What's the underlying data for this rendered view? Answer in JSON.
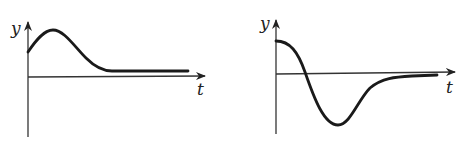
{
  "graphs": [
    {
      "name": "left-graph",
      "y_label": "y",
      "x_label": "t",
      "description": "Curve starts at positive y, rises to a peak, then decays to a positive constant level above the t-axis"
    },
    {
      "name": "right-graph",
      "y_label": "y",
      "x_label": "t",
      "description": "Curve starts at positive maximum, decreases crossing t-axis to a negative minimum, then rises and approaches the t-axis asymptotically"
    }
  ],
  "colors": {
    "background": "#ffffff",
    "ink": "#1a1a1a"
  }
}
